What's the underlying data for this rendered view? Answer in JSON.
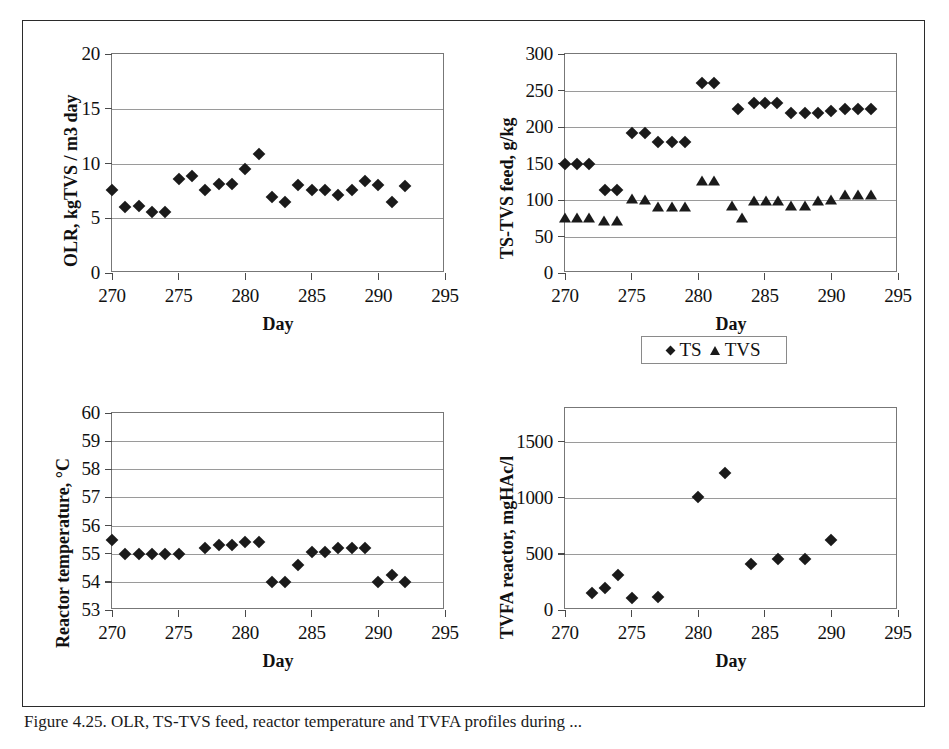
{
  "figure": {
    "caption": "Figure 4.25. OLR, TS-TVS feed, reactor temperature and TVFA profiles during ..."
  },
  "legend": {
    "items": [
      {
        "label": "TS",
        "marker": "diamond-icon"
      },
      {
        "label": "TVS",
        "marker": "triangle-icon"
      }
    ]
  },
  "chart_data": [
    {
      "id": "olr",
      "type": "scatter",
      "title": "",
      "xlabel": "Day",
      "ylabel": "OLR, kgTVS / m3 day",
      "xlim": [
        270,
        295
      ],
      "ylim": [
        0,
        20
      ],
      "xticks": [
        270,
        275,
        280,
        285,
        290,
        295
      ],
      "yticks": [
        0,
        5,
        10,
        15,
        20
      ],
      "grid": true,
      "series": [
        {
          "name": "OLR",
          "marker": "diamond",
          "points": [
            [
              270.0,
              7.6
            ],
            [
              271.0,
              6.0
            ],
            [
              272.0,
              6.1
            ],
            [
              273.0,
              5.6
            ],
            [
              274.0,
              5.6
            ],
            [
              275.0,
              8.6
            ],
            [
              276.0,
              8.9
            ],
            [
              277.0,
              7.6
            ],
            [
              278.0,
              8.1
            ],
            [
              279.0,
              8.1
            ],
            [
              280.0,
              9.5
            ],
            [
              281.0,
              10.9
            ],
            [
              282.0,
              6.9
            ],
            [
              283.0,
              6.5
            ],
            [
              284.0,
              8.0
            ],
            [
              285.0,
              7.6
            ],
            [
              286.0,
              7.6
            ],
            [
              287.0,
              7.1
            ],
            [
              288.0,
              7.6
            ],
            [
              289.0,
              8.4
            ],
            [
              290.0,
              8.0
            ],
            [
              291.0,
              6.5
            ],
            [
              292.0,
              7.9
            ]
          ]
        }
      ]
    },
    {
      "id": "ts-tvs-feed",
      "type": "scatter",
      "title": "",
      "xlabel": "Day",
      "ylabel": "TS-TVS feed, g/kg",
      "xlim": [
        270,
        295
      ],
      "ylim": [
        0,
        300
      ],
      "xticks": [
        270,
        275,
        280,
        285,
        290,
        295
      ],
      "yticks": [
        0,
        50,
        100,
        150,
        200,
        250,
        300
      ],
      "grid": true,
      "series": [
        {
          "name": "TS",
          "marker": "diamond",
          "points": [
            [
              270.0,
              150
            ],
            [
              270.9,
              150
            ],
            [
              271.8,
              150
            ],
            [
              273.0,
              114
            ],
            [
              273.9,
              114
            ],
            [
              275.0,
              192
            ],
            [
              276.0,
              192
            ],
            [
              277.0,
              180
            ],
            [
              278.0,
              180
            ],
            [
              279.0,
              180
            ],
            [
              280.3,
              260
            ],
            [
              281.2,
              260
            ],
            [
              283.0,
              225
            ],
            [
              284.2,
              233
            ],
            [
              285.0,
              233
            ],
            [
              285.9,
              233
            ],
            [
              287.0,
              219
            ],
            [
              288.0,
              219
            ],
            [
              289.0,
              219
            ],
            [
              290.0,
              222
            ],
            [
              291.0,
              225
            ],
            [
              292.0,
              225
            ],
            [
              293.0,
              225
            ]
          ]
        },
        {
          "name": "TVS",
          "marker": "triangle",
          "points": [
            [
              270.0,
              75
            ],
            [
              270.9,
              76
            ],
            [
              271.8,
              76
            ],
            [
              272.9,
              71
            ],
            [
              273.9,
              71
            ],
            [
              275.0,
              101
            ],
            [
              276.0,
              100
            ],
            [
              277.0,
              91
            ],
            [
              278.0,
              91
            ],
            [
              279.0,
              91
            ],
            [
              280.3,
              126
            ],
            [
              281.2,
              126
            ],
            [
              282.5,
              92
            ],
            [
              283.3,
              76
            ],
            [
              284.2,
              99
            ],
            [
              285.1,
              99
            ],
            [
              286.0,
              99
            ],
            [
              287.0,
              92
            ],
            [
              288.0,
              92
            ],
            [
              289.0,
              99
            ],
            [
              290.0,
              100
            ],
            [
              291.0,
              107
            ],
            [
              292.0,
              107
            ],
            [
              293.0,
              107
            ]
          ]
        }
      ]
    },
    {
      "id": "reactor-temperature",
      "type": "scatter",
      "title": "",
      "xlabel": "Day",
      "ylabel": "Reactor temperature, °C",
      "xlim": [
        270,
        295
      ],
      "ylim": [
        53,
        60
      ],
      "xticks": [
        270,
        275,
        280,
        285,
        290,
        295
      ],
      "yticks": [
        53,
        54,
        55,
        56,
        57,
        58,
        59,
        60
      ],
      "grid": true,
      "series": [
        {
          "name": "Reactor temperature",
          "marker": "diamond",
          "points": [
            [
              270.0,
              55.5
            ],
            [
              271.0,
              55.0
            ],
            [
              272.0,
              55.0
            ],
            [
              273.0,
              55.0
            ],
            [
              274.0,
              55.0
            ],
            [
              275.0,
              55.0
            ],
            [
              277.0,
              55.2
            ],
            [
              278.0,
              55.3
            ],
            [
              279.0,
              55.3
            ],
            [
              280.0,
              55.4
            ],
            [
              281.0,
              55.4
            ],
            [
              282.0,
              54.0
            ],
            [
              283.0,
              54.0
            ],
            [
              284.0,
              54.6
            ],
            [
              285.0,
              55.05
            ],
            [
              286.0,
              55.05
            ],
            [
              287.0,
              55.2
            ],
            [
              288.0,
              55.2
            ],
            [
              289.0,
              55.2
            ],
            [
              290.0,
              54.0
            ],
            [
              291.0,
              54.25
            ],
            [
              292.0,
              54.0
            ]
          ]
        }
      ]
    },
    {
      "id": "tvfa-reactor",
      "type": "scatter",
      "title": "",
      "xlabel": "Day",
      "ylabel": "TVFA reactor, mgHAc/l",
      "xlim": [
        270,
        295
      ],
      "ylim": [
        0,
        1800
      ],
      "xticks": [
        270,
        275,
        280,
        285,
        290,
        295
      ],
      "yticks": [
        0,
        500,
        1000,
        1500
      ],
      "grid": true,
      "series": [
        {
          "name": "TVFA reactor",
          "marker": "diamond",
          "points": [
            [
              272.0,
              150
            ],
            [
              273.0,
              200
            ],
            [
              274.0,
              310
            ],
            [
              275.0,
              110
            ],
            [
              277.0,
              120
            ],
            [
              280.0,
              1010
            ],
            [
              282.0,
              1220
            ],
            [
              284.0,
              410
            ],
            [
              286.0,
              455
            ],
            [
              288.0,
              455
            ],
            [
              290.0,
              625
            ]
          ]
        }
      ]
    }
  ]
}
